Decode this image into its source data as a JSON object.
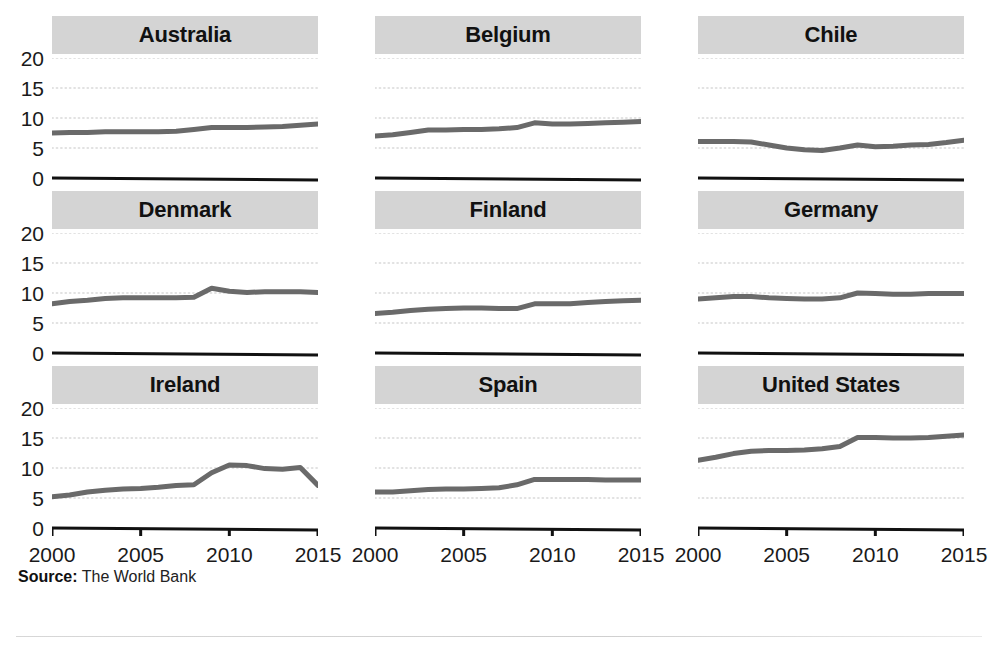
{
  "figure": {
    "ghost_top_text": "",
    "source_prefix": "Source:",
    "source_text": " The World Bank"
  },
  "axis": {
    "y_ticks": [
      "20",
      "15",
      "10",
      "5",
      "0"
    ],
    "y_values": [
      20,
      15,
      10,
      5,
      0
    ],
    "x_ticks": [
      "2000",
      "2005",
      "2010",
      "2015"
    ],
    "x_values": [
      2000,
      2005,
      2010,
      2015
    ]
  },
  "style": {
    "line_color": "#6a6a6a",
    "title_band_color": "#d4d4d4",
    "grid_color": "#d9d9d9",
    "axis_color": "#111111",
    "text_color": "#1a1a1a"
  },
  "chart_data": {
    "type": "line",
    "title": "",
    "subtitle": "",
    "xlabel": "",
    "ylabel": "",
    "xlim": [
      2000,
      2015
    ],
    "ylim": [
      0,
      20
    ],
    "grid": "horizontal-dotted",
    "legend": "none",
    "layout": "small-multiples 3x3",
    "x": [
      2000,
      2001,
      2002,
      2003,
      2004,
      2005,
      2006,
      2007,
      2008,
      2009,
      2010,
      2011,
      2012,
      2013,
      2014,
      2015
    ],
    "source": "The World Bank",
    "panels": [
      {
        "name": "Australia",
        "values": [
          7.5,
          7.6,
          7.6,
          7.7,
          7.7,
          7.7,
          7.7,
          7.8,
          8.1,
          8.4,
          8.4,
          8.4,
          8.5,
          8.6,
          8.8,
          9.0
        ]
      },
      {
        "name": "Belgium",
        "values": [
          7.0,
          7.2,
          7.6,
          8.0,
          8.0,
          8.1,
          8.1,
          8.2,
          8.4,
          9.2,
          9.0,
          9.0,
          9.1,
          9.2,
          9.3,
          9.4
        ]
      },
      {
        "name": "Chile",
        "values": [
          6.1,
          6.1,
          6.1,
          6.0,
          5.5,
          5.0,
          4.7,
          4.6,
          5.0,
          5.5,
          5.2,
          5.3,
          5.5,
          5.6,
          5.9,
          6.3
        ]
      },
      {
        "name": "Denmark",
        "values": [
          8.2,
          8.6,
          8.8,
          9.1,
          9.2,
          9.2,
          9.2,
          9.2,
          9.3,
          10.8,
          10.3,
          10.1,
          10.2,
          10.2,
          10.2,
          10.1
        ]
      },
      {
        "name": "Finland",
        "values": [
          6.6,
          6.8,
          7.1,
          7.3,
          7.4,
          7.5,
          7.5,
          7.4,
          7.4,
          8.2,
          8.2,
          8.2,
          8.4,
          8.6,
          8.7,
          8.8
        ]
      },
      {
        "name": "Germany",
        "values": [
          9.0,
          9.2,
          9.4,
          9.4,
          9.2,
          9.1,
          9.0,
          9.0,
          9.2,
          10.0,
          9.9,
          9.8,
          9.8,
          9.9,
          9.9,
          9.9
        ]
      },
      {
        "name": "Ireland",
        "values": [
          5.2,
          5.5,
          6.0,
          6.3,
          6.5,
          6.6,
          6.8,
          7.0,
          7.2,
          9.0,
          10.5,
          10.4,
          10.0,
          9.8,
          10.0,
          10.1
        ]
      },
      {
        "name": "Spain",
        "values": [
          6.0,
          6.0,
          6.2,
          6.4,
          6.5,
          6.5,
          6.6,
          6.7,
          7.2,
          8.1,
          8.1,
          8.1,
          8.1,
          8.0,
          8.0,
          8.0
        ]
      },
      {
        "name": "United States",
        "values": [
          11.3,
          11.8,
          12.4,
          12.8,
          12.9,
          12.9,
          13.0,
          13.2,
          13.6,
          15.1,
          15.1,
          15.0,
          15.0,
          15.1,
          15.3,
          15.5
        ]
      }
    ],
    "panel_overrides": {
      "Ireland": {
        "values": [
          5.2,
          5.5,
          6.0,
          6.3,
          6.5,
          6.6,
          6.8,
          7.1,
          7.2,
          9.2,
          10.5,
          10.4,
          9.9,
          9.8,
          10.1,
          7.1
        ]
      }
    }
  }
}
